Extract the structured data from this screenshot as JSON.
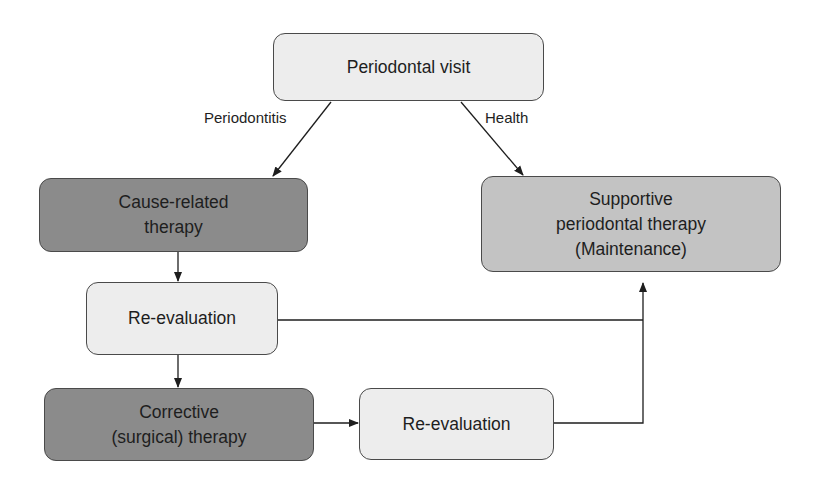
{
  "diagram": {
    "type": "flowchart",
    "colors": {
      "light_fill": "#ededed",
      "medium_fill": "#c3c3c3",
      "dark_fill": "#8b8b8b",
      "stroke": "#4a4a4a"
    },
    "nodes": {
      "periodontal_visit": {
        "lines": [
          "Periodontal visit"
        ]
      },
      "cause_related": {
        "lines": [
          "Cause-related",
          "therapy"
        ]
      },
      "supportive": {
        "lines": [
          "Supportive",
          "periodontal therapy",
          "(Maintenance)"
        ]
      },
      "reevaluation_1": {
        "lines": [
          "Re-evaluation"
        ]
      },
      "corrective": {
        "lines": [
          "Corrective",
          "(surgical) therapy"
        ]
      },
      "reevaluation_2": {
        "lines": [
          "Re-evaluation"
        ]
      }
    },
    "edge_labels": {
      "periodontitis": "Periodontitis",
      "health": "Health"
    },
    "edges": [
      {
        "from": "periodontal_visit",
        "to": "cause_related",
        "label": "Periodontitis"
      },
      {
        "from": "periodontal_visit",
        "to": "supportive",
        "label": "Health"
      },
      {
        "from": "cause_related",
        "to": "reevaluation_1"
      },
      {
        "from": "reevaluation_1",
        "to": "corrective"
      },
      {
        "from": "reevaluation_1",
        "to": "supportive"
      },
      {
        "from": "corrective",
        "to": "reevaluation_2"
      },
      {
        "from": "reevaluation_2",
        "to": "supportive"
      }
    ]
  }
}
